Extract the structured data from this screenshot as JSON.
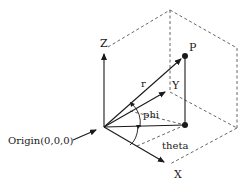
{
  "diagram": {
    "colors": {
      "stroke": "#1a1a1a",
      "dashed": "#555555",
      "background": "#ffffff"
    },
    "labels": {
      "z_axis": "Z",
      "y_axis": "Y",
      "x_axis": "X",
      "point": "P",
      "radius": "r",
      "phi": "phi",
      "theta": "theta",
      "origin": "Origin(0,0,0)"
    },
    "points": {
      "origin": [
        104,
        127
      ],
      "z_tip": [
        104,
        52
      ],
      "y_tip": [
        167,
        90
      ],
      "x_tip": [
        166,
        164
      ],
      "p": [
        185,
        56
      ],
      "p_projection": [
        185,
        125
      ]
    }
  }
}
